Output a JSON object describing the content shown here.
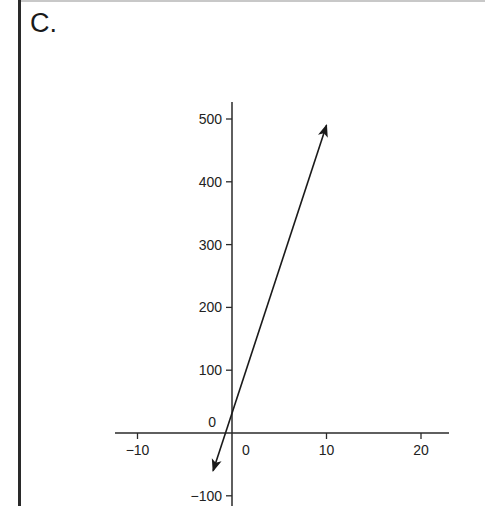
{
  "panel": {
    "label": "C."
  },
  "chart_data": {
    "type": "line",
    "title": "",
    "xlabel": "",
    "ylabel": "",
    "xlim": [
      -13,
      23
    ],
    "ylim": [
      -100,
      530
    ],
    "x_ticks": [
      -10,
      0,
      10,
      20
    ],
    "x_tick_labels": [
      "−10",
      "0",
      "10",
      "20"
    ],
    "y_ticks": [
      -100,
      0,
      100,
      200,
      300,
      400,
      500
    ],
    "y_tick_labels": [
      "−100",
      "0",
      "100",
      "200",
      "300",
      "400",
      "500"
    ],
    "grid": false,
    "legend": null,
    "series": [
      {
        "name": "line",
        "x": [
          -2,
          10
        ],
        "y": [
          -60,
          490
        ],
        "arrows": "both",
        "passes_through": [
          0,
          0
        ]
      }
    ],
    "colors": {
      "line": "#1a1a1a",
      "axis": "#2a2a2a",
      "frame": "#2a2a2a"
    }
  }
}
